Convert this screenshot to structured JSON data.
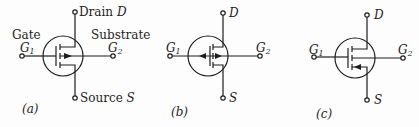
{
  "diagram": {
    "colors": {
      "ink": "#1e1e1e",
      "background": "#fdfdfd"
    },
    "panels": [
      {
        "id": "a",
        "caption": "(a)",
        "labels": {
          "gate_word": "Gate",
          "g1": "G",
          "g1_sub": "1",
          "substrate_word": "Substrate",
          "g2": "G",
          "g2_sub": "2",
          "drain_word": "Drain",
          "drain_letter": "D",
          "source_word": "Source",
          "source_letter": "S"
        },
        "arrow": "substrate arrow pointing inward (toward channel)"
      },
      {
        "id": "b",
        "caption": "(b)",
        "labels": {
          "g1": "G",
          "g1_sub": "1",
          "g2": "G",
          "g2_sub": "2",
          "drain_letter": "D",
          "source_letter": "S"
        },
        "arrow": "substrate arrows pointing both ways"
      },
      {
        "id": "c",
        "caption": "(c)",
        "labels": {
          "g1": "G",
          "g1_sub": "1",
          "g2": "G",
          "g2_sub": "2",
          "drain_letter": "D",
          "source_letter": "S"
        },
        "arrow": "arrow on source lead pointing inward"
      }
    ]
  }
}
